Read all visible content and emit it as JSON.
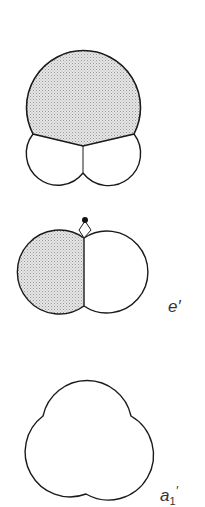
{
  "figures": [
    {
      "id": "top",
      "description": "Three-lobe orbital, upper lobe shaded",
      "label": ""
    },
    {
      "id": "middle",
      "description": "Two-lobe orbital with left lobe shaded and nucleus dot at top",
      "label": "e′"
    },
    {
      "id": "bottom",
      "description": "Trefoil (three-lobe) symmetric orbital outline",
      "label": "a",
      "label_subscript": "1",
      "label_prime": "′"
    }
  ],
  "colors": {
    "stroke": "#1a1a1a",
    "shade": "#d4d4d4",
    "background": "#ffffff"
  }
}
